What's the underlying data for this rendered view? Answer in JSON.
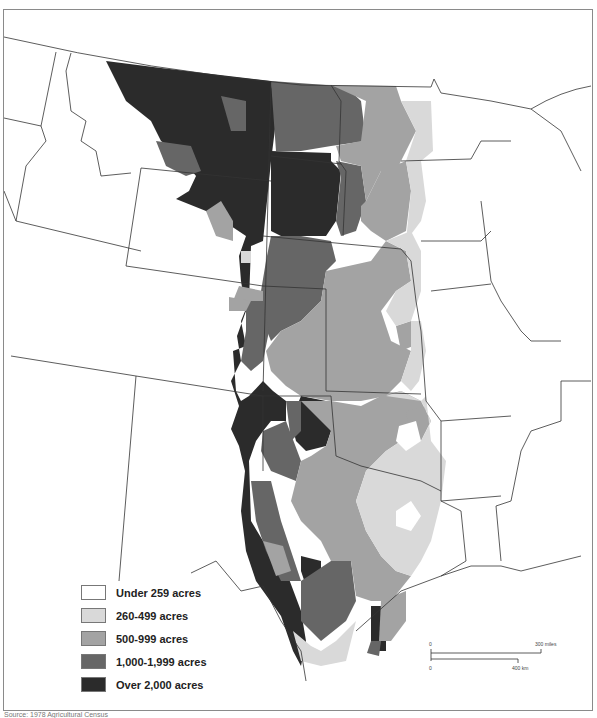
{
  "map": {
    "title": "Average farm size by county, Great Plains",
    "legend": {
      "items": [
        {
          "label": "Under 259 acres",
          "color": "#ffffff"
        },
        {
          "label": "260-499 acres",
          "color": "#d9d9d9"
        },
        {
          "label": "500-999 acres",
          "color": "#a3a3a3"
        },
        {
          "label": "1,000-1,999 acres",
          "color": "#666666"
        },
        {
          "label": "Over 2,000 acres",
          "color": "#2b2b2b"
        }
      ]
    },
    "scale": {
      "miles_zero": "0",
      "miles_label": "300 miles",
      "km_zero": "0",
      "km_label": "400 km"
    },
    "source": "Source: 1978 Agricultural Census"
  }
}
